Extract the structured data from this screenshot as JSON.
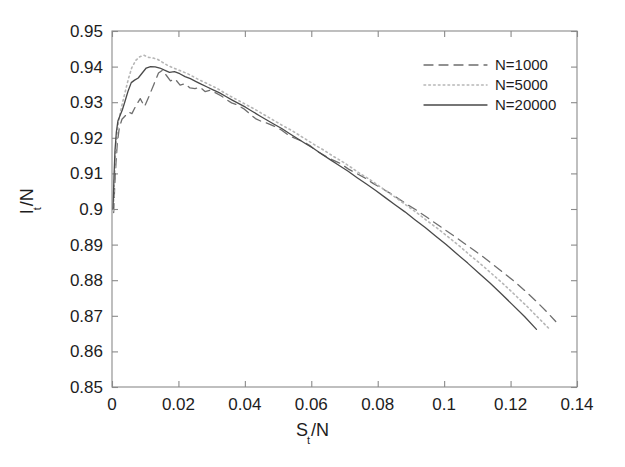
{
  "chart_data": {
    "type": "line",
    "title": "",
    "xlabel": "S_t/N",
    "ylabel": "I_t/N",
    "xlabel_base": "S",
    "xlabel_sub": "t",
    "xlabel_tail": "/N",
    "ylabel_base": "I",
    "ylabel_sub": "t",
    "ylabel_tail": "/N",
    "xlim": [
      0,
      0.14
    ],
    "ylim": [
      0.85,
      0.95
    ],
    "xticks": [
      0,
      0.02,
      0.04,
      0.06,
      0.08,
      0.1,
      0.12,
      0.14
    ],
    "xtick_labels": [
      "0",
      "0.02",
      "0.04",
      "0.06",
      "0.08",
      "0.1",
      "0.12",
      "0.14"
    ],
    "yticks": [
      0.85,
      0.86,
      0.87,
      0.88,
      0.89,
      0.9,
      0.91,
      0.92,
      0.93,
      0.94,
      0.95
    ],
    "ytick_labels": [
      "0.85",
      "0.86",
      "0.87",
      "0.88",
      "0.89",
      "0.9",
      "0.91",
      "0.92",
      "0.93",
      "0.94",
      "0.95"
    ],
    "grid": false,
    "legend_position": "top-right",
    "box": true,
    "tick_direction": "in",
    "series": [
      {
        "name": "N=1000",
        "style": "dashed",
        "color": "#6e6e6e",
        "x": [
          0.0005,
          0.0008,
          0.0012,
          0.0016,
          0.0022,
          0.003,
          0.004,
          0.005,
          0.006,
          0.0072,
          0.0085,
          0.0098,
          0.0112,
          0.0126,
          0.014,
          0.0152,
          0.0164,
          0.0176,
          0.019,
          0.0205,
          0.022,
          0.0235,
          0.025,
          0.0265,
          0.028,
          0.0296,
          0.0312,
          0.0328,
          0.0344,
          0.036,
          0.0378,
          0.0396,
          0.0414,
          0.0432,
          0.045,
          0.047,
          0.049,
          0.051,
          0.053,
          0.0552,
          0.0574,
          0.0596,
          0.0618,
          0.064,
          0.0664,
          0.0688,
          0.0712,
          0.0736,
          0.076,
          0.0786,
          0.0812,
          0.0838,
          0.0864,
          0.089,
          0.0918,
          0.0946,
          0.0974,
          0.1002,
          0.103,
          0.106,
          0.109,
          0.112,
          0.115,
          0.118,
          0.1212,
          0.1244,
          0.1276,
          0.1308,
          0.1336
        ],
        "y": [
          0.899,
          0.906,
          0.913,
          0.9185,
          0.9228,
          0.9252,
          0.9262,
          0.9272,
          0.9268,
          0.929,
          0.931,
          0.9288,
          0.9318,
          0.935,
          0.9382,
          0.939,
          0.9375,
          0.936,
          0.9365,
          0.9348,
          0.9352,
          0.934,
          0.9338,
          0.9342,
          0.933,
          0.9334,
          0.9326,
          0.9318,
          0.9308,
          0.9298,
          0.9292,
          0.9282,
          0.9268,
          0.9254,
          0.9246,
          0.924,
          0.9232,
          0.9222,
          0.9208,
          0.9198,
          0.919,
          0.9178,
          0.9162,
          0.915,
          0.9138,
          0.9128,
          0.9112,
          0.91,
          0.9088,
          0.9072,
          0.9058,
          0.9044,
          0.9028,
          0.9012,
          0.8996,
          0.8978,
          0.896,
          0.8942,
          0.8924,
          0.8904,
          0.8884,
          0.8864,
          0.8842,
          0.882,
          0.8796,
          0.877,
          0.8742,
          0.8712,
          0.8684
        ]
      },
      {
        "name": "N=5000",
        "style": "dotted",
        "color": "#b6b6b6",
        "x": [
          0.0004,
          0.0007,
          0.001,
          0.0014,
          0.0019,
          0.0025,
          0.0032,
          0.004,
          0.005,
          0.006,
          0.0072,
          0.0084,
          0.0096,
          0.011,
          0.0124,
          0.0138,
          0.0152,
          0.0166,
          0.018,
          0.0196,
          0.0212,
          0.0228,
          0.0244,
          0.026,
          0.0278,
          0.0296,
          0.0314,
          0.0332,
          0.035,
          0.037,
          0.039,
          0.041,
          0.043,
          0.0452,
          0.0474,
          0.0496,
          0.0518,
          0.0542,
          0.0566,
          0.059,
          0.0614,
          0.064,
          0.0666,
          0.0692,
          0.0718,
          0.0746,
          0.0774,
          0.0802,
          0.083,
          0.086,
          0.089,
          0.092,
          0.095,
          0.0982,
          0.1014,
          0.1046,
          0.1078,
          0.1112,
          0.1146,
          0.118,
          0.1214,
          0.125,
          0.1286,
          0.1316
        ],
        "y": [
          0.8995,
          0.9075,
          0.9145,
          0.92,
          0.924,
          0.9272,
          0.93,
          0.933,
          0.9368,
          0.9398,
          0.9418,
          0.9428,
          0.9432,
          0.9426,
          0.9424,
          0.942,
          0.9412,
          0.9404,
          0.9398,
          0.9392,
          0.9386,
          0.938,
          0.9372,
          0.9364,
          0.9356,
          0.9348,
          0.934,
          0.933,
          0.932,
          0.931,
          0.93,
          0.929,
          0.928,
          0.9268,
          0.9256,
          0.9244,
          0.9232,
          0.922,
          0.9206,
          0.9192,
          0.9178,
          0.9164,
          0.9148,
          0.9134,
          0.9118,
          0.91,
          0.9084,
          0.9066,
          0.9048,
          0.9028,
          0.9008,
          0.8988,
          0.8966,
          0.8944,
          0.892,
          0.8896,
          0.887,
          0.8844,
          0.8816,
          0.8788,
          0.8758,
          0.8726,
          0.8692,
          0.8664
        ]
      },
      {
        "name": "N=20000",
        "style": "solid",
        "color": "#4a4a4a",
        "x": [
          0.0003,
          0.0006,
          0.0009,
          0.0013,
          0.0018,
          0.0024,
          0.0031,
          0.0039,
          0.0048,
          0.0058,
          0.0068,
          0.0079,
          0.0091,
          0.0103,
          0.0116,
          0.013,
          0.0144,
          0.0158,
          0.0173,
          0.0188,
          0.0204,
          0.022,
          0.0236,
          0.0253,
          0.027,
          0.0288,
          0.0306,
          0.0324,
          0.0343,
          0.0362,
          0.0382,
          0.0402,
          0.0423,
          0.0444,
          0.0466,
          0.0488,
          0.0511,
          0.0534,
          0.0558,
          0.0582,
          0.0607,
          0.0632,
          0.0658,
          0.0684,
          0.0711,
          0.0738,
          0.0766,
          0.0794,
          0.0823,
          0.0852,
          0.0882,
          0.0912,
          0.0943,
          0.0974,
          0.1006,
          0.1038,
          0.1071,
          0.1104,
          0.1138,
          0.1172,
          0.1207,
          0.1242,
          0.1278
        ],
        "y": [
          0.9,
          0.909,
          0.9165,
          0.9215,
          0.9248,
          0.9262,
          0.9278,
          0.9302,
          0.933,
          0.9355,
          0.9362,
          0.9368,
          0.9382,
          0.9396,
          0.94,
          0.9399,
          0.9396,
          0.939,
          0.9384,
          0.9386,
          0.938,
          0.9372,
          0.9366,
          0.9358,
          0.935,
          0.9342,
          0.9334,
          0.9326,
          0.9316,
          0.9306,
          0.9296,
          0.9286,
          0.9274,
          0.9262,
          0.925,
          0.9238,
          0.9226,
          0.9212,
          0.9198,
          0.9184,
          0.917,
          0.9154,
          0.9138,
          0.9122,
          0.9106,
          0.9088,
          0.907,
          0.9052,
          0.9032,
          0.9012,
          0.8992,
          0.897,
          0.8948,
          0.8924,
          0.89,
          0.8874,
          0.8848,
          0.882,
          0.8792,
          0.8762,
          0.873,
          0.8698,
          0.8662
        ]
      }
    ]
  },
  "legend": {
    "entries": [
      {
        "label": "N=1000"
      },
      {
        "label": "N=5000"
      },
      {
        "label": "N=20000"
      }
    ]
  }
}
